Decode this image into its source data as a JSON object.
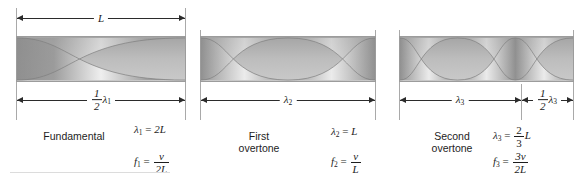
{
  "figure": {
    "type": "standing-wave-harmonics-diagram",
    "string_length_label": "L",
    "ink_color": "#2b2b2b",
    "bar_fill": "#b4b4b4",
    "wall_color": "#a9a9a9"
  },
  "panels": [
    {
      "name": "fundamental",
      "caption_line1": "Fundamental",
      "caption_line2": "",
      "loops": 1,
      "top_dimension": "L",
      "bottom_dimensions": [
        {
          "frac_num": "1",
          "frac_den": "2",
          "symbol": "λ",
          "sub": "1"
        }
      ],
      "wavelength_eq": {
        "lhs_symbol": "λ",
        "lhs_sub": "1",
        "equals": "=",
        "rhs_plain": "2L"
      },
      "frequency_eq": {
        "lhs_symbol": "f",
        "lhs_sub": "1",
        "equals": "=",
        "rhs_num": "v",
        "rhs_den": "2L"
      }
    },
    {
      "name": "first-overtone",
      "caption_line1": "First",
      "caption_line2": "overtone",
      "loops": 2,
      "top_dimension": "",
      "bottom_dimensions": [
        {
          "frac_num": "",
          "frac_den": "",
          "symbol": "λ",
          "sub": "2"
        }
      ],
      "wavelength_eq": {
        "lhs_symbol": "λ",
        "lhs_sub": "2",
        "equals": "=",
        "rhs_plain": "L"
      },
      "frequency_eq": {
        "lhs_symbol": "f",
        "lhs_sub": "2",
        "equals": "=",
        "rhs_num": "v",
        "rhs_den": "L"
      }
    },
    {
      "name": "second-overtone",
      "caption_line1": "Second",
      "caption_line2": "overtone",
      "loops": 3,
      "top_dimension": "",
      "bottom_dimensions": [
        {
          "frac_num": "",
          "frac_den": "",
          "symbol": "λ",
          "sub": "3"
        },
        {
          "frac_num": "1",
          "frac_den": "2",
          "symbol": "λ",
          "sub": "3"
        }
      ],
      "wavelength_eq": {
        "lhs_symbol": "λ",
        "lhs_sub": "3",
        "equals": "=",
        "rhs_num": "2",
        "rhs_den": "3",
        "rhs_tail": "L"
      },
      "frequency_eq": {
        "lhs_symbol": "f",
        "lhs_sub": "3",
        "equals": "=",
        "rhs_num": "3v",
        "rhs_den": "2L"
      }
    }
  ]
}
